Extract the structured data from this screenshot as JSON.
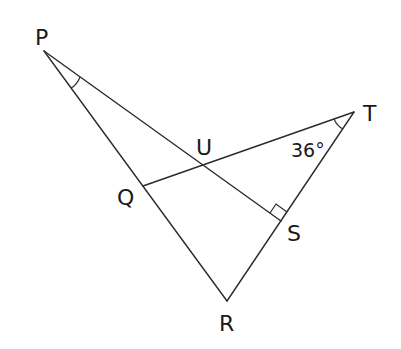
{
  "diagram": {
    "type": "geometry",
    "points": {
      "P": {
        "label": "P",
        "x": 44,
        "y": 51
      },
      "Q": {
        "label": "Q",
        "x": 143,
        "y": 186
      },
      "R": {
        "label": "R",
        "x": 227,
        "y": 301
      },
      "S": {
        "label": "S",
        "x": 281,
        "y": 221
      },
      "T": {
        "label": "T",
        "x": 354,
        "y": 112
      },
      "U": {
        "label": "U",
        "x": 204,
        "y": 165
      }
    },
    "segments": [
      {
        "from": "P",
        "to": "R"
      },
      {
        "from": "P",
        "to": "S"
      },
      {
        "from": "R",
        "to": "T"
      },
      {
        "from": "Q",
        "to": "T"
      }
    ],
    "angle_marks": [
      {
        "at": "P",
        "type": "arc"
      },
      {
        "at": "T",
        "type": "arc",
        "value": "36°"
      },
      {
        "at": "S",
        "type": "right-angle"
      }
    ],
    "labels": {
      "P": "P",
      "Q": "Q",
      "R": "R",
      "S": "S",
      "T": "T",
      "U": "U",
      "angle_T": "36°"
    }
  }
}
